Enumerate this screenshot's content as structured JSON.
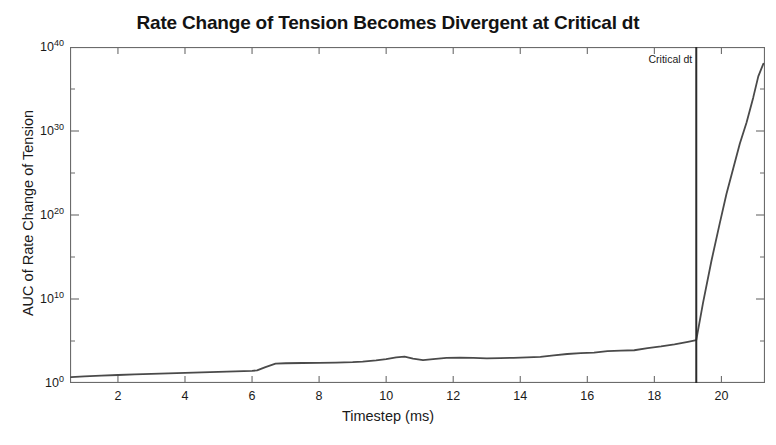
{
  "figure": {
    "title": "Rate Change of Tension Becomes Divergent at Critical dt",
    "background_color": "#ffffff",
    "axis_color": "#6b6b6b",
    "line_color": "#4a4a4a",
    "critical_line_color": "#2b2b2b"
  },
  "axes": {
    "x_label": "Timestep (ms)",
    "y_label": "AUC of Rate Change of Tension",
    "x_ticks": [
      "2",
      "4",
      "6",
      "8",
      "10",
      "12",
      "14",
      "16",
      "18",
      "20"
    ],
    "y_ticks": [
      "10",
      "10",
      "10",
      "10",
      "10"
    ],
    "y_tick_exponents": [
      "0",
      "10",
      "20",
      "30",
      "40"
    ]
  },
  "annotations": {
    "critical_dt_label": "Critical dt"
  },
  "chart_data": {
    "type": "line",
    "title": "Rate Change of Tension Becomes Divergent at Critical dt",
    "xlabel": "Timestep (ms)",
    "ylabel": "AUC of Rate Change of Tension",
    "xlim": [
      0.57,
      21.3
    ],
    "ylim": [
      1.0,
      1e+40
    ],
    "yscale": "log",
    "xscale": "linear",
    "grid": false,
    "legend": null,
    "x_tick_values": [
      2,
      4,
      6,
      8,
      10,
      12,
      14,
      16,
      18,
      20
    ],
    "y_tick_values": [
      1.0,
      10000000000.0,
      1e+20,
      1e+30,
      1e+40
    ],
    "y_minor_tick_values": [
      100000.0,
      1000000000000000.0,
      1e+25,
      1e+35
    ],
    "series": [
      {
        "name": "AUC of Rate Change of Tension",
        "color": "#4a4a4a",
        "x": [
          0.6,
          1.0,
          1.5,
          2.0,
          2.5,
          3.0,
          3.5,
          4.0,
          4.5,
          5.0,
          5.5,
          6.0,
          6.15,
          6.4,
          6.7,
          7.0,
          7.5,
          8.0,
          8.5,
          9.0,
          9.3,
          9.7,
          10.0,
          10.3,
          10.55,
          10.8,
          11.1,
          11.4,
          11.8,
          12.2,
          12.6,
          13.0,
          13.4,
          13.8,
          14.2,
          14.6,
          15.0,
          15.4,
          15.8,
          16.2,
          16.6,
          17.0,
          17.4,
          17.8,
          18.2,
          18.6,
          19.0,
          19.25,
          19.45,
          19.7,
          19.95,
          20.15,
          20.35,
          20.55,
          20.75,
          20.95,
          21.1,
          21.25
        ],
        "y_log10": [
          0.7,
          0.8,
          0.88,
          0.95,
          1.02,
          1.08,
          1.15,
          1.2,
          1.27,
          1.32,
          1.38,
          1.45,
          1.5,
          1.9,
          2.3,
          2.35,
          2.38,
          2.4,
          2.42,
          2.48,
          2.55,
          2.7,
          2.85,
          3.05,
          3.15,
          2.9,
          2.72,
          2.85,
          3.0,
          3.02,
          3.0,
          2.92,
          2.95,
          3.0,
          3.05,
          3.1,
          3.3,
          3.45,
          3.55,
          3.62,
          3.8,
          3.85,
          3.9,
          4.15,
          4.35,
          4.6,
          4.9,
          5.1,
          9.5,
          14.5,
          19.0,
          22.5,
          25.5,
          28.5,
          31.0,
          34.0,
          36.5,
          38.0
        ]
      }
    ],
    "vertical_lines": [
      {
        "name": "Critical dt",
        "x": 19.25,
        "label": "Critical dt",
        "color": "#2b2b2b"
      }
    ]
  }
}
